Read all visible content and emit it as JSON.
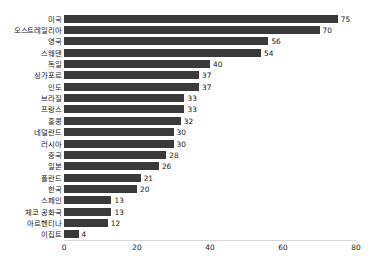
{
  "chart_data": {
    "type": "bar",
    "orientation": "horizontal",
    "title": "",
    "subtitle": "",
    "xlabel": "",
    "ylabel": "",
    "xlim": [
      0,
      80
    ],
    "xticks": [
      "0",
      "20",
      "40",
      "60",
      "80"
    ],
    "grid": false,
    "legend": null,
    "bar_color": "#3a3a3a",
    "background_color": "#ffffff",
    "show_value_labels": true,
    "categories": [
      "미국",
      "오스트레일리아",
      "영국",
      "스웨덴",
      "독일",
      "싱가포르",
      "인도",
      "브라질",
      "프랑스",
      "홍콩",
      "네덜란드",
      "러시아",
      "중국",
      "일본",
      "폴란드",
      "한국",
      "스페인",
      "체코 공화국",
      "아르헨티나",
      "이집트"
    ],
    "values": [
      75,
      70,
      56,
      54,
      40,
      37,
      37,
      33,
      33,
      32,
      30,
      30,
      28,
      26,
      21,
      20,
      13,
      13,
      12,
      4
    ],
    "value_labels": [
      "75",
      "70",
      "56",
      "54",
      "40",
      "37",
      "37",
      "33",
      "33",
      "32",
      "30",
      "30",
      "28",
      "26",
      "21",
      "20",
      "13",
      "13",
      "12",
      "4"
    ]
  }
}
